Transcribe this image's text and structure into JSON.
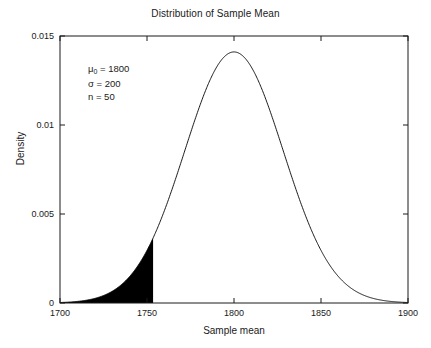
{
  "chart_data": {
    "type": "line",
    "title": "Distribution of Sample Mean",
    "xlabel": "Sample mean",
    "ylabel": "Density",
    "xlim": [
      1700,
      1900
    ],
    "ylim": [
      0,
      0.015
    ],
    "xticks": [
      1700,
      1750,
      1800,
      1850,
      1900
    ],
    "xtick_labels": [
      "1700",
      "1750",
      "1800",
      "1850",
      "1900"
    ],
    "yticks": [
      0,
      0.005,
      0.01,
      0.015
    ],
    "ytick_labels": [
      "0",
      "0.005",
      "0.01",
      "0.015"
    ],
    "grid": false,
    "legend": null,
    "box": true,
    "tick_direction": "in",
    "series": [
      {
        "name": "Normal density of sample mean",
        "kind": "normal_pdf",
        "mean": 1800,
        "sigma": 28.2843,
        "color": "#000000",
        "line_width": 0.9,
        "peak_value": 0.0141,
        "x": [
          1700,
          1710,
          1720,
          1730,
          1740,
          1750,
          1753.5,
          1760,
          1770,
          1780,
          1790,
          1800,
          1810,
          1820,
          1830,
          1840,
          1850,
          1860,
          1870,
          1880,
          1890,
          1900
        ],
        "y": [
          5e-05,
          0.00019,
          0.00061,
          0.00165,
          0.00379,
          0.00739,
          0.0009,
          0.01224,
          0.00174,
          0.01174,
          0.01372,
          0.0141,
          0.01372,
          0.01174,
          0.0088,
          0.00578,
          0.00333,
          0.00165,
          0.00071,
          0.00026,
          8e-05,
          2e-05
        ]
      }
    ],
    "shaded_region": {
      "name": "rejection-region",
      "from": 1700,
      "to": 1753.5,
      "color": "#000000",
      "fill": "solid",
      "critical_value": 1753.5,
      "alpha": 0.05,
      "height_at_cutoff": 0.0037
    },
    "annotations": [
      {
        "id": "mu0",
        "text": "μ",
        "sub": "0",
        "rest": " = 1800"
      },
      {
        "id": "sigma",
        "text": "σ = 200",
        "sub": "",
        "rest": ""
      },
      {
        "id": "n",
        "text": "n = 50",
        "sub": "",
        "rest": ""
      }
    ],
    "annotation_values": {
      "mu0": 1800,
      "sigma": 200,
      "n": 50
    }
  },
  "colors": {
    "axis": "#1a1a1a",
    "curve": "#000000",
    "fill": "#000000",
    "background": "#ffffff"
  }
}
